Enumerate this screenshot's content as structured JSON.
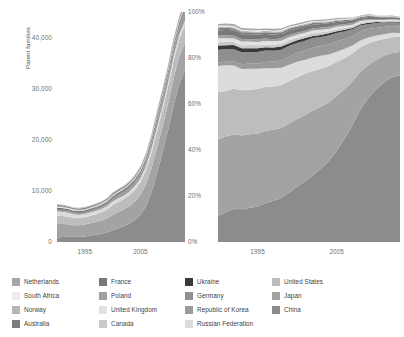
{
  "chart_data": [
    {
      "type": "area",
      "id": "absolute-stacked-area",
      "title": "",
      "xlabel": "",
      "ylabel": "Patent families",
      "stacked": true,
      "normalized": false,
      "grid": false,
      "legend_position": "bottom",
      "xlim": [
        1990,
        2013
      ],
      "ylim": [
        0,
        45000
      ],
      "yticks": [
        "0",
        "10,000",
        "20,000",
        "30,000",
        "40,000"
      ],
      "ytick_values": [
        0,
        10000,
        20000,
        30000,
        40000
      ],
      "xticks": [
        "1995",
        "2005"
      ],
      "xtick_values": [
        1995,
        2005
      ],
      "x": [
        1990,
        1991,
        1992,
        1993,
        1994,
        1995,
        1996,
        1997,
        1998,
        1999,
        2000,
        2001,
        2002,
        2003,
        2004,
        2005,
        2006,
        2007,
        2008,
        2009,
        2010,
        2011,
        2012,
        2013
      ],
      "series": [
        {
          "name": "China",
          "color": "#8c8c8c",
          "values": [
            900,
            980,
            1050,
            1000,
            1020,
            1100,
            1250,
            1400,
            1600,
            1900,
            2300,
            2700,
            3100,
            3600,
            4300,
            5300,
            7000,
            9800,
            13500,
            17600,
            22000,
            27000,
            31000,
            33500
          ]
        },
        {
          "name": "Japan",
          "color": "#a3a3a3",
          "values": [
            2600,
            2550,
            2400,
            2300,
            2250,
            2300,
            2400,
            2500,
            2600,
            2750,
            3000,
            3150,
            3250,
            3400,
            3600,
            3900,
            4300,
            4700,
            5000,
            5100,
            5200,
            5300,
            5400,
            5500
          ]
        },
        {
          "name": "United States",
          "color": "#bdbdbd",
          "values": [
            1600,
            1550,
            1500,
            1450,
            1400,
            1420,
            1480,
            1550,
            1620,
            1720,
            1900,
            2000,
            2050,
            2150,
            2300,
            2500,
            2750,
            3000,
            3200,
            3250,
            3300,
            3350,
            3400,
            3400
          ]
        },
        {
          "name": "Russian Federation",
          "color": "#dcdcdc",
          "values": [
            900,
            850,
            760,
            700,
            660,
            640,
            640,
            650,
            650,
            660,
            700,
            710,
            720,
            730,
            760,
            790,
            830,
            870,
            900,
            910,
            920,
            930,
            930,
            930
          ]
        },
        {
          "name": "Republic of Korea",
          "color": "#9a9a9a",
          "values": [
            120,
            130,
            140,
            150,
            165,
            180,
            200,
            230,
            270,
            320,
            390,
            440,
            480,
            540,
            620,
            720,
            860,
            1020,
            1180,
            1260,
            1330,
            1400,
            1450,
            1500
          ]
        },
        {
          "name": "Germany",
          "color": "#8f8f8f",
          "values": [
            430,
            420,
            410,
            400,
            395,
            400,
            410,
            420,
            435,
            455,
            490,
            510,
            520,
            540,
            570,
            610,
            660,
            710,
            750,
            770,
            790,
            800,
            810,
            820
          ]
        },
        {
          "name": "Ukraine",
          "color": "#3a3a3a",
          "values": [
            150,
            145,
            140,
            130,
            125,
            120,
            120,
            120,
            120,
            122,
            126,
            128,
            130,
            132,
            136,
            140,
            146,
            152,
            158,
            160,
            162,
            164,
            165,
            165
          ]
        },
        {
          "name": "Canada",
          "color": "#c9c9c9",
          "values": [
            110,
            108,
            105,
            102,
            100,
            100,
            102,
            105,
            108,
            112,
            120,
            124,
            127,
            131,
            137,
            145,
            155,
            165,
            174,
            178,
            181,
            184,
            186,
            188
          ]
        },
        {
          "name": "United Kingdom",
          "color": "#e2e2e2",
          "values": [
            130,
            127,
            124,
            120,
            118,
            117,
            118,
            120,
            122,
            126,
            133,
            136,
            139,
            143,
            149,
            157,
            167,
            178,
            187,
            191,
            194,
            197,
            199,
            200
          ]
        },
        {
          "name": "Poland",
          "color": "#9f9f9f",
          "values": [
            95,
            93,
            91,
            89,
            88,
            88,
            89,
            90,
            92,
            95,
            100,
            103,
            105,
            108,
            113,
            119,
            127,
            135,
            142,
            145,
            148,
            150,
            152,
            153
          ]
        },
        {
          "name": "France",
          "color": "#787878",
          "values": [
            180,
            176,
            172,
            168,
            165,
            164,
            165,
            167,
            170,
            176,
            186,
            191,
            195,
            201,
            210,
            222,
            237,
            253,
            266,
            272,
            277,
            281,
            284,
            286
          ]
        },
        {
          "name": "Australia",
          "color": "#7e7e7e",
          "values": [
            70,
            69,
            68,
            66,
            65,
            65,
            66,
            67,
            68,
            71,
            75,
            77,
            79,
            81,
            85,
            90,
            96,
            102,
            107,
            110,
            112,
            114,
            115,
            116
          ]
        },
        {
          "name": "Norway",
          "color": "#b6b6b6",
          "values": [
            45,
            44,
            43,
            42,
            41,
            41,
            42,
            42,
            43,
            45,
            47,
            48,
            49,
            51,
            53,
            56,
            60,
            64,
            67,
            69,
            70,
            71,
            72,
            72
          ]
        },
        {
          "name": "South Africa",
          "color": "#ededed",
          "values": [
            40,
            39,
            38,
            37,
            36,
            36,
            37,
            37,
            38,
            40,
            42,
            43,
            44,
            45,
            47,
            50,
            53,
            57,
            60,
            61,
            62,
            63,
            64,
            64
          ]
        },
        {
          "name": "Netherlands",
          "color": "#a8a8a8",
          "values": [
            60,
            59,
            58,
            56,
            55,
            55,
            56,
            57,
            58,
            60,
            64,
            65,
            67,
            69,
            72,
            76,
            81,
            86,
            91,
            93,
            95,
            96,
            97,
            98
          ]
        }
      ]
    },
    {
      "type": "area",
      "id": "share-stacked-area",
      "title": "",
      "xlabel": "",
      "ylabel": "",
      "stacked": true,
      "normalized": true,
      "grid": false,
      "legend_position": "bottom",
      "xlim": [
        1990,
        2013
      ],
      "ylim": [
        0,
        100
      ],
      "yticks": [
        "0%",
        "20%",
        "40%",
        "60%",
        "80%",
        "100%"
      ],
      "ytick_values": [
        0,
        20,
        40,
        60,
        80,
        100
      ],
      "xticks": [
        "1995",
        "2005"
      ],
      "xtick_values": [
        1995,
        2005
      ],
      "x": [
        1990,
        1991,
        1992,
        1993,
        1994,
        1995,
        1996,
        1997,
        1998,
        1999,
        2000,
        2001,
        2002,
        2003,
        2004,
        2005,
        2006,
        2007,
        2008,
        2009,
        2010,
        2011,
        2012,
        2013
      ],
      "series": [
        {
          "name": "China",
          "color": "#8c8c8c",
          "values": [
            11.5,
            12.8,
            14.5,
            14.2,
            14.8,
            15.5,
            16.8,
            17.8,
            19.2,
            21.5,
            24.0,
            26.5,
            29.0,
            31.8,
            35.2,
            39.5,
            45.0,
            51.0,
            57.5,
            62.5,
            66.5,
            69.5,
            71.5,
            72.5
          ]
        },
        {
          "name": "Japan",
          "color": "#a3a3a3",
          "values": [
            33.0,
            33.0,
            32.5,
            32.0,
            32.0,
            31.8,
            31.5,
            31.0,
            30.5,
            30.0,
            29.5,
            28.8,
            28.0,
            27.0,
            25.5,
            23.8,
            21.5,
            19.0,
            16.5,
            14.5,
            12.8,
            11.5,
            10.8,
            10.2
          ]
        },
        {
          "name": "United States",
          "color": "#bdbdbd",
          "values": [
            20.5,
            20.0,
            19.8,
            19.6,
            19.5,
            19.3,
            19.0,
            18.8,
            18.6,
            18.5,
            18.2,
            17.8,
            17.3,
            16.6,
            15.8,
            14.8,
            13.5,
            12.0,
            10.6,
            9.3,
            8.2,
            7.3,
            6.8,
            6.4
          ]
        },
        {
          "name": "Russian Federation",
          "color": "#dcdcdc",
          "values": [
            11.5,
            11.0,
            10.0,
            9.4,
            9.0,
            8.7,
            8.3,
            7.9,
            7.5,
            7.1,
            6.6,
            6.2,
            5.9,
            5.5,
            5.1,
            4.6,
            4.0,
            3.5,
            3.0,
            2.6,
            2.3,
            2.0,
            1.9,
            1.8
          ]
        },
        {
          "name": "Republic of Korea",
          "color": "#9a9a9a",
          "values": [
            1.5,
            1.6,
            1.8,
            2.0,
            2.2,
            2.4,
            2.6,
            2.9,
            3.2,
            3.5,
            3.8,
            4.0,
            4.2,
            4.3,
            4.4,
            4.4,
            4.3,
            4.1,
            3.9,
            3.6,
            3.4,
            3.1,
            2.9,
            2.8
          ]
        },
        {
          "name": "Germany",
          "color": "#8f8f8f",
          "values": [
            5.5,
            5.4,
            5.3,
            5.2,
            5.1,
            5.0,
            4.9,
            4.8,
            4.7,
            4.6,
            4.5,
            4.3,
            4.2,
            4.0,
            3.8,
            3.6,
            3.3,
            2.9,
            2.6,
            2.3,
            2.0,
            1.8,
            1.7,
            1.6
          ]
        },
        {
          "name": "Ukraine",
          "color": "#3a3a3a",
          "values": [
            1.9,
            1.8,
            1.8,
            1.7,
            1.7,
            1.6,
            1.5,
            1.4,
            1.3,
            1.2,
            1.1,
            1.0,
            1.0,
            0.9,
            0.9,
            0.8,
            0.7,
            0.6,
            0.5,
            0.5,
            0.4,
            0.4,
            0.3,
            0.3
          ]
        },
        {
          "name": "Canada",
          "color": "#c9c9c9",
          "values": [
            1.4,
            1.4,
            1.3,
            1.3,
            1.3,
            1.3,
            1.2,
            1.2,
            1.2,
            1.2,
            1.1,
            1.1,
            1.1,
            1.0,
            1.0,
            0.9,
            0.8,
            0.7,
            0.6,
            0.5,
            0.5,
            0.4,
            0.4,
            0.4
          ]
        },
        {
          "name": "United Kingdom",
          "color": "#e2e2e2",
          "values": [
            1.7,
            1.7,
            1.6,
            1.6,
            1.5,
            1.5,
            1.5,
            1.4,
            1.4,
            1.4,
            1.3,
            1.3,
            1.2,
            1.2,
            1.1,
            1.0,
            0.9,
            0.8,
            0.7,
            0.6,
            0.5,
            0.5,
            0.4,
            0.4
          ]
        },
        {
          "name": "Poland",
          "color": "#9f9f9f",
          "values": [
            1.2,
            1.2,
            1.2,
            1.1,
            1.1,
            1.1,
            1.1,
            1.0,
            1.0,
            1.0,
            1.0,
            0.9,
            0.9,
            0.9,
            0.8,
            0.8,
            0.7,
            0.6,
            0.5,
            0.5,
            0.4,
            0.4,
            0.3,
            0.3
          ]
        },
        {
          "name": "France",
          "color": "#787878",
          "values": [
            2.3,
            2.3,
            2.2,
            2.2,
            2.1,
            2.1,
            2.0,
            2.0,
            1.9,
            1.9,
            1.8,
            1.8,
            1.7,
            1.6,
            1.5,
            1.4,
            1.3,
            1.1,
            1.0,
            0.9,
            0.8,
            0.7,
            0.6,
            0.6
          ]
        },
        {
          "name": "Australia",
          "color": "#7e7e7e",
          "values": [
            0.9,
            0.9,
            0.9,
            0.9,
            0.8,
            0.8,
            0.8,
            0.8,
            0.8,
            0.8,
            0.7,
            0.7,
            0.7,
            0.6,
            0.6,
            0.6,
            0.5,
            0.5,
            0.4,
            0.4,
            0.3,
            0.3,
            0.3,
            0.2
          ]
        },
        {
          "name": "Norway",
          "color": "#b6b6b6",
          "values": [
            0.6,
            0.6,
            0.6,
            0.5,
            0.5,
            0.5,
            0.5,
            0.5,
            0.5,
            0.5,
            0.4,
            0.4,
            0.4,
            0.4,
            0.4,
            0.3,
            0.3,
            0.3,
            0.2,
            0.2,
            0.2,
            0.2,
            0.2,
            0.1
          ]
        },
        {
          "name": "South Africa",
          "color": "#ededed",
          "values": [
            0.5,
            0.5,
            0.5,
            0.5,
            0.5,
            0.5,
            0.4,
            0.4,
            0.4,
            0.4,
            0.4,
            0.4,
            0.4,
            0.3,
            0.3,
            0.3,
            0.3,
            0.2,
            0.2,
            0.2,
            0.2,
            0.1,
            0.1,
            0.1
          ]
        },
        {
          "name": "Netherlands",
          "color": "#a8a8a8",
          "values": [
            0.8,
            0.8,
            0.8,
            0.8,
            0.7,
            0.7,
            0.7,
            0.7,
            0.7,
            0.7,
            0.6,
            0.6,
            0.6,
            0.6,
            0.5,
            0.5,
            0.4,
            0.4,
            0.3,
            0.3,
            0.3,
            0.2,
            0.2,
            0.2
          ]
        }
      ]
    }
  ],
  "left_chart": {
    "ylabel": "Patent families",
    "yticks": [
      "40,000",
      "30,000",
      "20,000",
      "10,000",
      "0"
    ],
    "xticks": [
      "1995",
      "2005"
    ]
  },
  "right_chart": {
    "yticks": [
      "100%",
      "80%",
      "60%",
      "40%",
      "20%",
      "0%"
    ],
    "xticks": [
      "1995",
      "2005"
    ]
  },
  "legend": {
    "items": [
      {
        "label": "Netherlands",
        "color": "#a8a8a8",
        "col": 0,
        "row": 0
      },
      {
        "label": "South Africa",
        "color": "#ededed",
        "col": 0,
        "row": 1
      },
      {
        "label": "Norway",
        "color": "#b6b6b6",
        "col": 0,
        "row": 2
      },
      {
        "label": "Australia",
        "color": "#7e7e7e",
        "col": 0,
        "row": 3
      },
      {
        "label": "France",
        "color": "#787878",
        "col": 1,
        "row": 0
      },
      {
        "label": "Poland",
        "color": "#9f9f9f",
        "col": 1,
        "row": 1
      },
      {
        "label": "United Kingdom",
        "color": "#e2e2e2",
        "col": 1,
        "row": 2
      },
      {
        "label": "Canada",
        "color": "#c9c9c9",
        "col": 1,
        "row": 3
      },
      {
        "label": "Ukraine",
        "color": "#3a3a3a",
        "col": 2,
        "row": 0
      },
      {
        "label": "Germany",
        "color": "#8f8f8f",
        "col": 2,
        "row": 1
      },
      {
        "label": "Republic of Korea",
        "color": "#9a9a9a",
        "col": 2,
        "row": 2
      },
      {
        "label": "Russian Federation",
        "color": "#dcdcdc",
        "col": 2,
        "row": 3
      },
      {
        "label": "United States",
        "color": "#bdbdbd",
        "col": 3,
        "row": 0
      },
      {
        "label": "Japan",
        "color": "#a3a3a3",
        "col": 3,
        "row": 1
      },
      {
        "label": "China",
        "color": "#8c8c8c",
        "col": 3,
        "row": 2
      }
    ]
  }
}
